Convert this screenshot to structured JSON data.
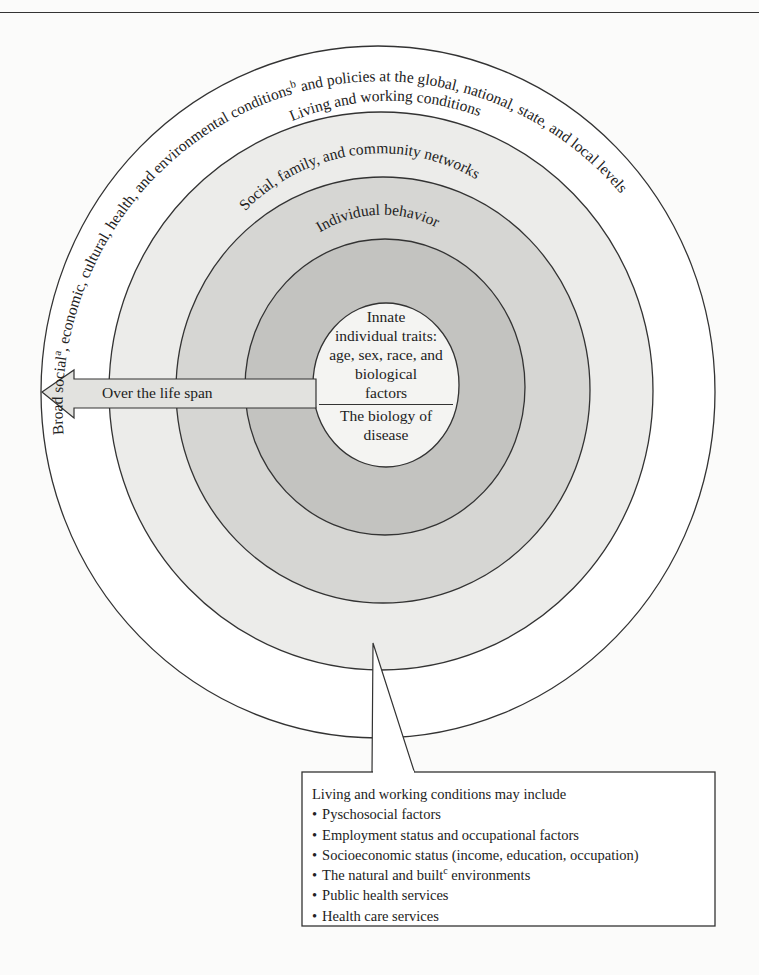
{
  "figure": {
    "rings": {
      "outer": {
        "label_prefix": "Broad social",
        "sup_a": "a",
        "label_mid": ", economic, cultural, health, and environmental conditions",
        "sup_b": "b",
        "label_suffix": " and policies at the global, national, state, and local levels",
        "fill": "#ffffff"
      },
      "living": {
        "label": "Living and working conditions",
        "fill": "#ececea"
      },
      "social": {
        "label": "Social, family, and community networks",
        "fill": "#d6d6d3"
      },
      "individual": {
        "label": "Individual behavior",
        "fill": "#c3c3c0"
      },
      "innate": {
        "lines": [
          "Innate",
          "individual traits:",
          "age, sex, race, and",
          "biological",
          "factors"
        ],
        "biology_lines": [
          "The biology of",
          "disease"
        ],
        "fill": "#f4f4f2"
      }
    },
    "arrow": {
      "label": "Over the life span",
      "fill": "#e2e2df"
    },
    "callout": {
      "title": "Living and working conditions may include",
      "items": [
        {
          "text": "Pyschosocial factors"
        },
        {
          "text": "Employment status and occupational factors"
        },
        {
          "text": "Socioeconomic status (income, education, occupation)"
        },
        {
          "text": "The natural and built",
          "sup": "c",
          "text_after": " environments"
        },
        {
          "text": "Public health services"
        },
        {
          "text": "Health care services"
        }
      ]
    },
    "line_color": "#333333"
  }
}
